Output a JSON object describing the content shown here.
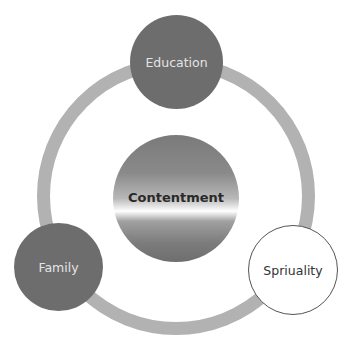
{
  "diagram": {
    "type": "cycle",
    "top_caption_clipped": "",
    "center": {
      "label": "Contentment"
    },
    "nodes": [
      {
        "label": "Education",
        "position": "top",
        "style": "dark"
      },
      {
        "label": "Spriuality",
        "position": "bottom-right",
        "style": "light"
      },
      {
        "label": "Family",
        "position": "bottom-left",
        "style": "dark"
      }
    ]
  },
  "colors": {
    "ring": "#b2b2b2",
    "dark_node": "#6d6d6d",
    "dark_node_text": "#e4e4e4",
    "light_node_border": "#555555",
    "center_text": "#2a2a2a"
  }
}
